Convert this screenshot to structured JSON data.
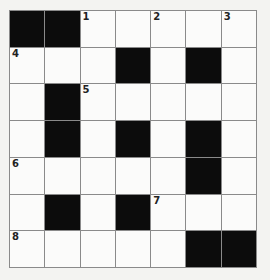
{
  "puzzle": {
    "rows": 7,
    "cols": 7,
    "colors": {
      "black": "#0c0c0c",
      "white": "#fbfbfa",
      "line": "#8a8a8a"
    },
    "grid": [
      [
        "#",
        "#",
        "1",
        "",
        "2",
        "",
        "3"
      ],
      [
        "4",
        "",
        "",
        "#",
        "",
        "#",
        ""
      ],
      [
        "",
        "#",
        "5",
        "",
        "",
        "",
        ""
      ],
      [
        "",
        "#",
        "",
        "#",
        "",
        "#",
        ""
      ],
      [
        "6",
        "",
        "",
        "",
        "",
        "#",
        ""
      ],
      [
        "",
        "#",
        "",
        "#",
        "7",
        "",
        ""
      ],
      [
        "8",
        "",
        "",
        "",
        "",
        "#",
        "#"
      ]
    ]
  }
}
